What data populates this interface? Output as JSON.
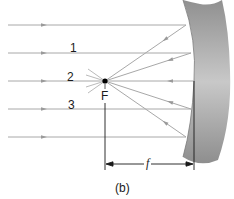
{
  "diagram": {
    "type": "concave-mirror-ray-diagram",
    "ray_labels": [
      "1",
      "2",
      "3"
    ],
    "focal_point_label": "F",
    "focal_length_label": "f",
    "caption": "(b)",
    "colors": {
      "ray": "#a8a8a8",
      "mirror_light": "#d4d4d4",
      "mirror_dark": "#8a8a8a",
      "ink": "#1a1a1a",
      "focal_point": "#000000"
    },
    "incoming_rays_y": [
      25,
      53,
      81,
      109,
      137
    ],
    "mirror_hit_points": [
      [
        186,
        25
      ],
      [
        191,
        53
      ],
      [
        194,
        81
      ],
      [
        191,
        109
      ],
      [
        186,
        137
      ]
    ],
    "focal_point": [
      105,
      81
    ]
  }
}
